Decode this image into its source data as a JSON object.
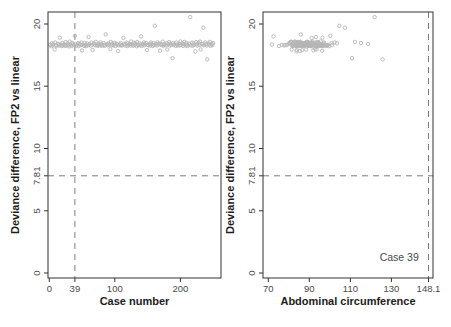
{
  "figure": {
    "width": 451,
    "height": 327,
    "background": "#ffffff",
    "colors": {
      "axis": "#333333",
      "tick_label": "#4a4a4a",
      "axis_title": "#1c1c1c",
      "point_stroke": "#b5b5b5",
      "reference_line": "#7d7d7d"
    },
    "marker": "open-circle",
    "point_radius": 1.7
  },
  "chart_data": [
    {
      "type": "scatter",
      "id": "case-number",
      "title": "",
      "xlabel": "Case number",
      "ylabel": "Deviance difference, FP2 vs linear",
      "marker": "open-circle",
      "grid": false,
      "legend": null,
      "box": {
        "left": 48,
        "top": 12,
        "right": 221,
        "bottom": 278
      },
      "xlim": [
        -2,
        262
      ],
      "ylim": [
        -0.4,
        20.96
      ],
      "xticks": [
        {
          "v": 0,
          "label": "0"
        },
        {
          "v": 39,
          "label": "39"
        },
        {
          "v": 100,
          "label": "100"
        },
        {
          "v": 200,
          "label": "200"
        }
      ],
      "yticks": [
        {
          "v": 0,
          "label": "0"
        },
        {
          "v": 5,
          "label": "5"
        },
        {
          "v": 7.81,
          "label": "7.81"
        },
        {
          "v": 10,
          "label": "10"
        },
        {
          "v": 15,
          "label": "15"
        },
        {
          "v": 20,
          "label": "20"
        }
      ],
      "vline": 39,
      "hline": 7.81,
      "annotation": null,
      "x": [
        1,
        3,
        4,
        5,
        6,
        8,
        9,
        10,
        11,
        13,
        14,
        15,
        16,
        18,
        19,
        20,
        21,
        23,
        24,
        25,
        26,
        28,
        29,
        30,
        31,
        33,
        34,
        35,
        36,
        38,
        39,
        40,
        41,
        43,
        44,
        45,
        46,
        48,
        49,
        50,
        51,
        53,
        54,
        55,
        56,
        58,
        59,
        60,
        61,
        63,
        64,
        65,
        66,
        68,
        69,
        70,
        71,
        73,
        74,
        75,
        76,
        78,
        79,
        80,
        81,
        83,
        84,
        85,
        86,
        88,
        89,
        90,
        91,
        93,
        94,
        95,
        96,
        98,
        99,
        100,
        101,
        103,
        104,
        105,
        106,
        108,
        109,
        110,
        111,
        113,
        114,
        115,
        116,
        118,
        119,
        120,
        121,
        123,
        124,
        125,
        126,
        128,
        129,
        130,
        131,
        133,
        134,
        135,
        136,
        138,
        139,
        140,
        141,
        143,
        144,
        145,
        146,
        148,
        149,
        150,
        151,
        153,
        154,
        155,
        156,
        158,
        159,
        160,
        161,
        163,
        164,
        165,
        166,
        168,
        169,
        170,
        171,
        173,
        174,
        175,
        176,
        178,
        179,
        180,
        181,
        183,
        184,
        185,
        186,
        188,
        189,
        190,
        191,
        193,
        194,
        195,
        196,
        198,
        199,
        200,
        201,
        203,
        204,
        205,
        206,
        208,
        209,
        210,
        211,
        213,
        214,
        215,
        216,
        218,
        219,
        220,
        221,
        223,
        224,
        225,
        226,
        228,
        229,
        230,
        231,
        233,
        234,
        235,
        236,
        238,
        239,
        240,
        241,
        243,
        244,
        245,
        246,
        248,
        249,
        250
      ],
      "y": [
        18.32,
        18.21,
        18.45,
        18.28,
        18.38,
        17.95,
        18.52,
        18.3,
        18.24,
        18.41,
        18.35,
        18.27,
        18.9,
        18.33,
        18.22,
        18.47,
        18.29,
        18.36,
        18.25,
        18.55,
        18.26,
        18.44,
        18.31,
        18.2,
        18.58,
        18.34,
        18.23,
        18.49,
        18.37,
        18.28,
        19.05,
        18.4,
        18.25,
        18.33,
        18.46,
        18.22,
        18.39,
        18.3,
        18.51,
        17.88,
        18.35,
        18.24,
        18.48,
        18.31,
        18.21,
        18.43,
        18.29,
        18.95,
        18.38,
        18.26,
        18.5,
        18.33,
        17.92,
        18.45,
        18.36,
        18.28,
        18.57,
        18.31,
        18.24,
        18.42,
        18.3,
        18.53,
        18.27,
        18.39,
        18.23,
        18.46,
        18.32,
        18.25,
        19.15,
        18.37,
        18.29,
        18.44,
        18.34,
        17.98,
        18.56,
        18.3,
        18.42,
        18.26,
        18.35,
        18.48,
        18.23,
        18.41,
        18.33,
        17.82,
        18.28,
        18.36,
        18.47,
        18.25,
        18.31,
        18.88,
        18.4,
        18.27,
        18.35,
        18.5,
        18.22,
        18.44,
        18.3,
        18.38,
        18.26,
        18.59,
        18.37,
        18.25,
        18.49,
        18.32,
        18.43,
        18.21,
        18.55,
        18.34,
        18.27,
        18.45,
        18.31,
        19.0,
        18.24,
        18.39,
        18.52,
        18.28,
        18.36,
        18.47,
        17.9,
        18.33,
        18.29,
        18.42,
        18.26,
        18.51,
        18.35,
        18.23,
        18.46,
        18.31,
        19.85,
        18.38,
        18.27,
        18.53,
        18.33,
        18.44,
        17.85,
        18.4,
        18.3,
        18.58,
        18.25,
        18.36,
        18.34,
        18.28,
        18.47,
        17.94,
        18.39,
        18.55,
        18.26,
        18.43,
        18.32,
        17.25,
        18.48,
        18.3,
        18.37,
        18.24,
        18.52,
        18.35,
        18.29,
        18.41,
        18.27,
        18.6,
        18.31,
        18.45,
        18.24,
        18.38,
        18.56,
        18.27,
        18.49,
        18.33,
        18.22,
        18.42,
        18.36,
        20.55,
        18.28,
        18.5,
        18.25,
        18.44,
        18.32,
        17.8,
        18.54,
        18.37,
        18.26,
        18.48,
        18.3,
        18.58,
        17.96,
        18.41,
        18.35,
        19.7,
        18.29,
        18.52,
        18.38,
        18.27,
        17.15,
        18.45,
        18.33,
        18.56,
        18.24,
        18.4,
        18.31,
        18.47
      ]
    },
    {
      "type": "scatter",
      "id": "abdominal-circumference",
      "title": "",
      "xlabel": "Abdominal circumference",
      "ylabel": "Deviance difference, FP2 vs linear",
      "marker": "open-circle",
      "grid": false,
      "legend": null,
      "box": {
        "left": 263,
        "top": 12,
        "right": 433,
        "bottom": 278
      },
      "xlim": [
        67.4,
        150.3
      ],
      "ylim": [
        -0.4,
        20.96
      ],
      "xticks": [
        {
          "v": 70,
          "label": "70"
        },
        {
          "v": 90,
          "label": "90"
        },
        {
          "v": 110,
          "label": "110"
        },
        {
          "v": 130,
          "label": "130"
        },
        {
          "v": 148.1,
          "label": "148.1"
        }
      ],
      "yticks": [
        {
          "v": 0,
          "label": "0"
        },
        {
          "v": 5,
          "label": "5"
        },
        {
          "v": 7.81,
          "label": "7.81"
        },
        {
          "v": 10,
          "label": "10"
        },
        {
          "v": 15,
          "label": "15"
        },
        {
          "v": 20,
          "label": "20"
        }
      ],
      "vline": 148.1,
      "hline": 7.81,
      "annotation": {
        "x": 133.8,
        "y": 0.96,
        "text": "Case 39"
      },
      "x": [
        78.2,
        84.5,
        90.1,
        86.3,
        92.7,
        81.4,
        88.9,
        95.2,
        83.6,
        89.4,
        91.8,
        85.1,
        96.4,
        87.2,
        93.5,
        80.3,
        98.7,
        86.8,
        90.9,
        94.1,
        82.1,
        88.4,
        76.5,
        91.2,
        85.7,
        97.3,
        89.8,
        84.2,
        92.4,
        87.6,
        100.2,
        83.1,
        90.5,
        86.1,
        94.8,
        81.7,
        89.1,
        95.7,
        88.2,
        92.0,
        71.8,
        86.6,
        91.5,
        84.8,
        96.9,
        88.6,
        82.7,
        93.2,
        87.9,
        90.3,
        85.4,
        99.1,
        83.9,
        91.9,
        87.1,
        94.4,
        80.9,
        89.6,
        96.1,
        86.4,
        84.0,
        90.7,
        77.8,
        87.4,
        93.9,
        82.4,
        88.0,
        95.9,
        85.9,
        91.4,
        89.3,
        103.5,
        86.9,
        92.9,
        81.1,
        97.8,
        88.5,
        84.4,
        90.0,
        94.6,
        75.2,
        87.7,
        92.2,
        85.5,
        98.2,
        83.4,
        89.9,
        94.9,
        86.6,
        91.1,
        79.9,
        96.6,
        88.8,
        84.9,
        93.7,
        87.3,
        101.1,
        85.2,
        90.8,
        82.9,
        88.3,
        94.3,
        83.7,
        91.6,
        86.2,
        99.6,
        84.7,
        90.4,
        95.4,
        87.5,
        92.6,
        72.5,
        89.5,
        85.8,
        97.1,
        88.1,
        83.2,
        93.0,
        86.5,
        91.3,
        81.9,
        89.2,
        95.0,
        84.3,
        92.3,
        87.0,
        100.8,
        85.6,
        104.6,
        90.2,
        86.0,
        93.4,
        88.7,
        82.2,
        96.2,
        89.0,
        85.3,
        91.7,
        87.8,
        94.0,
        86.7,
        92.5,
        80.6,
        88.4,
        94.5,
        83.0,
        90.6,
        96.8,
        85.0,
        110.8,
        89.7,
        84.6,
        91.0,
        87.4,
        102.3,
        86.1,
        93.3,
        88.0,
        82.5,
        95.5,
        90.1,
        84.1,
        96.5,
        87.6,
        81.3,
        92.8,
        88.6,
        94.7,
        83.5,
        89.8,
        86.3,
        121.8,
        91.2,
        85.7,
        98.4,
        87.0,
        92.1,
        83.8,
        89.3,
        95.8,
        85.6,
        91.5,
        79.0,
        88.9,
        93.6,
        86.8,
        82.0,
        107.4,
        90.5,
        84.5,
        96.0,
        89.4,
        125.7,
        87.2,
        92.4,
        112.3,
        85.9,
        118.6,
        88.3,
        115.2
      ],
      "y": [
        18.32,
        18.21,
        18.45,
        18.28,
        18.38,
        17.95,
        18.52,
        18.3,
        18.24,
        18.41,
        18.35,
        18.27,
        18.9,
        18.33,
        18.22,
        18.47,
        18.29,
        18.36,
        18.25,
        18.55,
        18.26,
        18.44,
        18.31,
        18.2,
        18.58,
        18.34,
        18.23,
        18.49,
        18.37,
        18.28,
        19.05,
        18.4,
        18.25,
        18.33,
        18.46,
        18.22,
        18.39,
        18.3,
        18.51,
        17.88,
        18.35,
        18.24,
        18.48,
        18.31,
        18.21,
        18.43,
        18.29,
        18.95,
        18.38,
        18.26,
        18.5,
        18.33,
        17.92,
        18.45,
        18.36,
        18.28,
        18.57,
        18.31,
        18.24,
        18.42,
        18.3,
        18.53,
        18.27,
        18.39,
        18.23,
        18.46,
        18.32,
        18.25,
        19.15,
        18.37,
        18.29,
        18.44,
        18.34,
        17.98,
        18.56,
        18.3,
        18.42,
        18.26,
        18.35,
        18.48,
        18.23,
        18.41,
        18.33,
        17.82,
        18.28,
        18.36,
        18.47,
        18.25,
        18.31,
        18.88,
        18.4,
        18.27,
        18.35,
        18.5,
        18.22,
        18.44,
        18.3,
        18.38,
        18.26,
        18.59,
        18.37,
        18.25,
        18.49,
        18.32,
        18.43,
        18.21,
        18.55,
        18.34,
        18.27,
        18.45,
        18.31,
        19.0,
        18.24,
        18.39,
        18.52,
        18.28,
        18.36,
        18.47,
        17.9,
        18.33,
        18.29,
        18.42,
        18.26,
        18.51,
        18.35,
        18.23,
        18.46,
        18.31,
        19.85,
        18.38,
        18.27,
        18.53,
        18.33,
        18.44,
        17.85,
        18.4,
        18.3,
        18.58,
        18.25,
        18.36,
        18.34,
        18.28,
        18.47,
        17.94,
        18.39,
        18.55,
        18.26,
        18.43,
        18.32,
        17.25,
        18.48,
        18.3,
        18.37,
        18.24,
        18.52,
        18.35,
        18.29,
        18.41,
        18.27,
        18.6,
        18.31,
        18.45,
        18.24,
        18.38,
        18.56,
        18.27,
        18.49,
        18.33,
        18.22,
        18.42,
        18.36,
        20.55,
        18.28,
        18.5,
        18.25,
        18.44,
        18.32,
        17.8,
        18.54,
        18.37,
        18.26,
        18.48,
        18.3,
        18.58,
        17.96,
        18.41,
        18.35,
        19.7,
        18.29,
        18.52,
        18.38,
        18.27,
        17.15,
        18.45,
        18.33,
        18.56,
        18.24,
        18.4,
        18.31,
        18.47
      ]
    }
  ]
}
